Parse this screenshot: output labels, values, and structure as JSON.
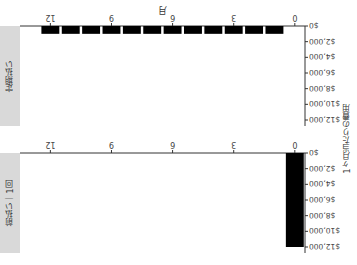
{
  "chart_data": [
    {
      "type": "bar",
      "panel_label": "前払い｜1回",
      "x": [
        0
      ],
      "values": [
        12000
      ],
      "xlabel": "月",
      "ylabel": "1ヶ月当たりの費用",
      "ylim": [
        0,
        12000
      ],
      "xlim": [
        0,
        13
      ],
      "xticks": [
        0,
        3,
        6,
        9,
        12
      ],
      "yticks": [
        "$0",
        "$2,000",
        "$4,000",
        "$6,000",
        "$8,000",
        "$10,000",
        "$12,000"
      ],
      "bar_color": "#000000"
    },
    {
      "type": "bar",
      "panel_label": "定期払い",
      "x": [
        1,
        2,
        3,
        4,
        5,
        6,
        7,
        8,
        9,
        10,
        11,
        12
      ],
      "values": [
        1000,
        1000,
        1000,
        1000,
        1000,
        1000,
        1000,
        1000,
        1000,
        1000,
        1000,
        1000
      ],
      "xlabel": "月",
      "ylabel": "1ヶ月当たりの費用",
      "ylim": [
        0,
        12000
      ],
      "xlim": [
        0,
        13
      ],
      "xticks": [
        0,
        3,
        6,
        9,
        12
      ],
      "yticks": [
        "$0",
        "$2,000",
        "$4,000",
        "$6,000",
        "$8,000",
        "$10,000",
        "$12,000"
      ],
      "bar_color": "#000000"
    }
  ],
  "labels": {
    "ylabel": "1ヶ月当たりの費用",
    "xlabel": "月",
    "panel1": "前払い｜1回",
    "panel2": "定期払い"
  },
  "colors": {
    "bar": "#000000",
    "strip": "#d9d9d9",
    "axis": "#333333"
  }
}
